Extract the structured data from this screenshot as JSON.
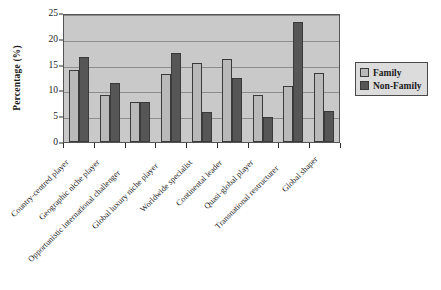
{
  "chart_data": {
    "type": "bar",
    "title": "",
    "xlabel": "",
    "ylabel": "Percentage (%)",
    "ylim": [
      0,
      25
    ],
    "yticks": [
      0,
      5,
      10,
      15,
      20,
      25
    ],
    "grid": true,
    "legend_position": "right",
    "categories": [
      "Country-centred player",
      "Geographic niche player",
      "Opportunistic international challenger",
      "Global luxury niche player",
      "Worldwide specialist",
      "Continental leader",
      "Quasi-global player",
      "Transnational restructurer",
      "Global shaper"
    ],
    "series": [
      {
        "name": "Family",
        "color": "#b9b9b9",
        "values": [
          13.9,
          9.2,
          7.8,
          13.2,
          15.3,
          16.1,
          9.2,
          10.8,
          13.4
        ]
      },
      {
        "name": "Non-Family",
        "color": "#565656",
        "values": [
          16.5,
          11.4,
          7.7,
          17.2,
          5.8,
          12.5,
          4.8,
          23.2,
          6.1
        ]
      }
    ]
  },
  "legend": {
    "items": [
      {
        "label": "Family",
        "swatch": "family"
      },
      {
        "label": "Non-Family",
        "swatch": "nonfamily"
      }
    ]
  }
}
